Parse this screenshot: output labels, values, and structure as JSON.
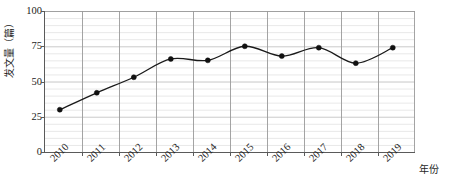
{
  "chart_data": {
    "type": "line",
    "title": "",
    "subtitle": "",
    "xlabel": "年份",
    "ylabel": "发文量（篇）",
    "categories": [
      "2010",
      "2011",
      "2012",
      "2013",
      "2014",
      "2015",
      "2016",
      "2017",
      "2018",
      "2019"
    ],
    "values": [
      30,
      42,
      53,
      66,
      65,
      75,
      68,
      74,
      63,
      74
    ],
    "series": [
      {
        "name": "发文量",
        "values": [
          30,
          42,
          53,
          66,
          65,
          75,
          68,
          74,
          63,
          74
        ]
      }
    ],
    "ylim": [
      0,
      100
    ],
    "y_ticks": [
      0,
      25,
      50,
      75,
      100
    ],
    "y_tick_labels": [
      "0",
      "25",
      "50",
      "75",
      "100"
    ],
    "y_minor_step": 5,
    "grid": "both",
    "legend": "none",
    "line_color": "#1a1a1a",
    "marker": "circle",
    "marker_color": "#111111",
    "major_gridline_color": "#9a9a9a",
    "minor_gridline_color": "#e2e2e2",
    "axis_color": "#5a5a5a",
    "background_color": "#ffffff"
  }
}
